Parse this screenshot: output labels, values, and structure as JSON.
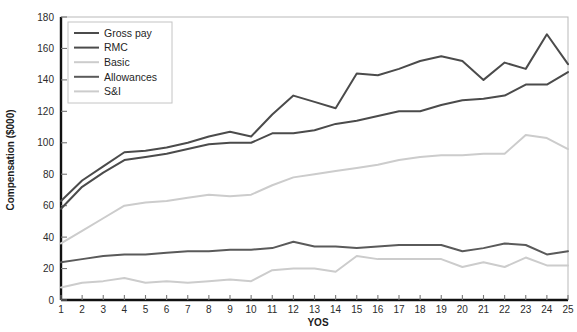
{
  "chart_data": {
    "type": "line",
    "title": "",
    "xlabel": "YOS",
    "ylabel": "Compensation ($000)",
    "xlim": [
      1,
      25
    ],
    "ylim": [
      0,
      180
    ],
    "ytick_step": 20,
    "grid": false,
    "legend_position": "top-left",
    "x": [
      1,
      2,
      3,
      4,
      5,
      6,
      7,
      8,
      9,
      10,
      11,
      12,
      13,
      14,
      15,
      16,
      17,
      18,
      19,
      20,
      21,
      22,
      23,
      24,
      25
    ],
    "xticklabels": [
      "1",
      "2",
      "3",
      "4",
      "5",
      "6",
      "7",
      "8",
      "9",
      "10",
      "11",
      "12",
      "13",
      "14",
      "15",
      "16",
      "17",
      "18",
      "19",
      "20",
      "21",
      "22",
      "23",
      "24",
      "25"
    ],
    "yticklabels": [
      "0",
      "20",
      "40",
      "60",
      "80",
      "100",
      "120",
      "140",
      "160",
      "180"
    ],
    "series": [
      {
        "name": "Gross pay",
        "color": "#4b4b4b",
        "width": 2.0,
        "values": [
          63,
          76,
          85,
          94,
          95,
          97,
          100,
          104,
          107,
          104,
          118,
          130,
          126,
          122,
          144,
          143,
          147,
          152,
          155,
          152,
          140,
          151,
          147,
          169,
          150
        ]
      },
      {
        "name": "RMC",
        "color": "#4b4b4b",
        "width": 2.0,
        "values": [
          58,
          72,
          81,
          89,
          91,
          93,
          96,
          99,
          100,
          100,
          106,
          106,
          108,
          112,
          114,
          117,
          120,
          120,
          124,
          127,
          128,
          130,
          137,
          137,
          145
        ]
      },
      {
        "name": "Basic",
        "color": "#cccccc",
        "width": 2.0,
        "values": [
          36,
          44,
          52,
          60,
          62,
          63,
          65,
          67,
          66,
          67,
          73,
          78,
          80,
          82,
          84,
          86,
          89,
          91,
          92,
          92,
          93,
          93,
          105,
          103,
          96
        ]
      },
      {
        "name": "Allowances",
        "color": "#5a5a5a",
        "width": 2.0,
        "values": [
          24,
          26,
          28,
          29,
          29,
          30,
          31,
          31,
          32,
          32,
          33,
          37,
          34,
          34,
          33,
          34,
          35,
          35,
          35,
          31,
          33,
          36,
          35,
          29,
          31
        ]
      },
      {
        "name": "S&I",
        "color": "#cccccc",
        "width": 2.0,
        "values": [
          8,
          11,
          12,
          14,
          11,
          12,
          11,
          12,
          13,
          12,
          19,
          20,
          20,
          18,
          28,
          26,
          26,
          26,
          26,
          21,
          24,
          21,
          27,
          22,
          22
        ]
      }
    ]
  },
  "legend": {
    "items": [
      {
        "label": "Gross pay"
      },
      {
        "label": "RMC"
      },
      {
        "label": "Basic"
      },
      {
        "label": "Allowances"
      },
      {
        "label": "S&I"
      }
    ]
  }
}
